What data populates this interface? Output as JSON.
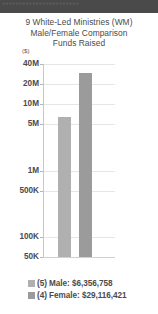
{
  "banner": {
    "text": "•••••••••••••••••••••••"
  },
  "title": {
    "line1": "9 White-Led Ministries (WM)",
    "line2": "Male/Female Comparison",
    "line3": "Funds Raised"
  },
  "unit_label": "($)",
  "legend": {
    "items": [
      {
        "label": "(5) Male: $6,356,758",
        "swatch_color": "#b0b0b0"
      },
      {
        "label": "(4) Female: $29,116,421",
        "swatch_color": "#9b9b9b"
      }
    ]
  },
  "colors": {
    "bar_male": "#b0b0b0",
    "bar_female": "#9b9b9b",
    "gridline": "#e6e6e6",
    "axis": "#c9c9c9",
    "text": "#4b4b4b",
    "banner_background": "#4a4a4a",
    "page_background": "#ffffff"
  },
  "chart_data": {
    "type": "bar",
    "title": "9 White-Led Ministries (WM) Male/Female Comparison Funds Raised",
    "xlabel": "",
    "ylabel": "($)",
    "yscale": "log",
    "grid": true,
    "legend_position": "bottom",
    "categories": [
      "(5) Male",
      "(4) Female"
    ],
    "values": [
      6356758,
      29116421
    ],
    "value_labels": [
      "$6,356,758",
      "$29,116,421"
    ],
    "counts": [
      5,
      4
    ],
    "series": [
      {
        "name": "Funds Raised",
        "values": [
          6356758,
          29116421
        ]
      }
    ],
    "ytick_labels": [
      "40M",
      "20M",
      "10M",
      "5M",
      "1M",
      "500K",
      "100K",
      "50K"
    ],
    "ytick_values": [
      40000000,
      20000000,
      10000000,
      5000000,
      1000000,
      500000,
      100000,
      50000
    ],
    "ylim": [
      50000,
      40000000
    ]
  }
}
